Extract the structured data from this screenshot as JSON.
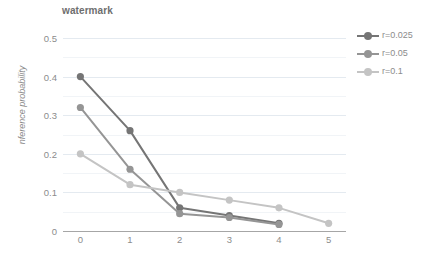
{
  "chart_data": {
    "type": "line",
    "title": "watermark",
    "xlabel": "",
    "ylabel": "nference probability",
    "xlim": [
      -0.35,
      5.35
    ],
    "ylim": [
      0,
      0.5
    ],
    "grid": true,
    "legend_position": "right",
    "x": [
      0,
      1,
      2,
      3,
      4,
      5
    ],
    "y_ticks": [
      "0.5",
      "0.4",
      "0.3",
      "0.2",
      "0.1",
      "0"
    ],
    "y_tick_values": [
      0.5,
      0.4,
      0.3,
      0.2,
      0.1,
      0
    ],
    "x_ticks": [
      "0",
      "1",
      "2",
      "3",
      "4",
      "5"
    ],
    "series": [
      {
        "name": "r=0.025",
        "color": "#757575",
        "x": [
          0,
          1,
          2,
          3,
          4
        ],
        "values": [
          0.4,
          0.26,
          0.06,
          0.04,
          0.02
        ]
      },
      {
        "name": "r=0.05",
        "color": "#959595",
        "x": [
          0,
          1,
          2,
          3,
          4
        ],
        "values": [
          0.32,
          0.16,
          0.045,
          0.035,
          0.017
        ]
      },
      {
        "name": "r=0.1",
        "color": "#c4c4c4",
        "x": [
          0,
          1,
          2,
          3,
          4,
          5
        ],
        "values": [
          0.2,
          0.12,
          0.1,
          0.08,
          0.06,
          0.02
        ]
      }
    ]
  },
  "colors": {
    "gridline": "#e4eaf0",
    "gridline_minor": "#f1f4f7",
    "axis": "#a6a6a6",
    "text": "#8c8c8c",
    "title": "#6e6e6e",
    "background": "#ffffff"
  }
}
